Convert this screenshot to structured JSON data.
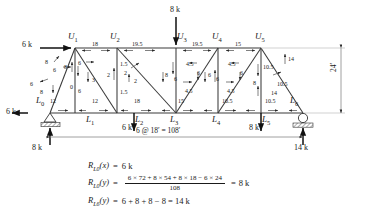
{
  "diagram": {
    "span_dimension": "6 @ 18′ = 108′",
    "height_dimension": "24′",
    "nodes": {
      "top": [
        {
          "name": "U1",
          "base": "U",
          "sub": "1",
          "x": 75,
          "y": 48
        },
        {
          "name": "U2",
          "base": "U",
          "sub": "2",
          "x": 117,
          "y": 48
        },
        {
          "name": "U3",
          "base": "U",
          "sub": "3",
          "x": 176,
          "y": 48
        },
        {
          "name": "U4",
          "base": "U",
          "sub": "4",
          "x": 218,
          "y": 48
        },
        {
          "name": "U5",
          "base": "U",
          "sub": "5",
          "x": 261,
          "y": 48
        }
      ],
      "bottom": [
        {
          "name": "L0",
          "base": "L",
          "sub": "0",
          "x": 50,
          "y": 113
        },
        {
          "name": "L1",
          "base": "L",
          "sub": "1",
          "x": 92,
          "y": 113
        },
        {
          "name": "L2",
          "base": "L",
          "sub": "2",
          "x": 134,
          "y": 113
        },
        {
          "name": "L3",
          "base": "L",
          "sub": "3",
          "x": 176,
          "y": 113
        },
        {
          "name": "L4",
          "base": "L",
          "sub": "4",
          "x": 218,
          "y": 113
        },
        {
          "name": "L5",
          "base": "L",
          "sub": "5",
          "x": 261,
          "y": 113
        },
        {
          "name": "L6",
          "base": "L",
          "sub": "6",
          "x": 303,
          "y": 113
        }
      ]
    },
    "applied_loads": [
      {
        "label": "6 k",
        "at": "U1",
        "direction": "right-horizontal"
      },
      {
        "label": "8 k",
        "at": "U3",
        "direction": "down-vertical"
      },
      {
        "label": "6 k",
        "at": "L2",
        "direction": "down-vertical"
      },
      {
        "label": "8 k",
        "at": "L5",
        "direction": "down-vertical"
      },
      {
        "label": "6 k",
        "at": "L0",
        "direction": "left-horizontal"
      }
    ],
    "reactions": [
      {
        "label": "8 k",
        "at": "L0",
        "direction": "up-vertical"
      },
      {
        "label": "14 k",
        "at": "L6",
        "direction": "up-vertical"
      }
    ],
    "top_chord_forces": [
      "18",
      "19.5",
      "19.5",
      "15",
      "14"
    ],
    "bottom_chord_forces": [
      "12",
      "12",
      "18",
      "15",
      "10.5",
      "10.5"
    ],
    "vertical_forces": [
      "0",
      "2",
      "8",
      "6",
      "8"
    ],
    "diagonal_forces": [
      "8",
      "6",
      "3",
      "2",
      "6",
      "6",
      "6",
      "14"
    ],
    "member_force_labels": [
      {
        "text": "6 k",
        "x": 22,
        "y": 41,
        "cls": "load"
      },
      {
        "text": "8 k",
        "x": 170,
        "y": 6,
        "cls": "load"
      },
      {
        "text": "6 k",
        "x": 122,
        "y": 124,
        "cls": "load"
      },
      {
        "text": "8 k",
        "x": 249,
        "y": 124,
        "cls": "load"
      },
      {
        "text": "6 k",
        "x": 6,
        "y": 108,
        "cls": "load"
      },
      {
        "text": "8 k",
        "x": 32,
        "y": 144,
        "cls": "load"
      },
      {
        "text": "14 k",
        "x": 294,
        "y": 144,
        "cls": "load"
      },
      {
        "text": "18",
        "x": 92,
        "y": 41,
        "cls": "force"
      },
      {
        "text": "19.5",
        "x": 132,
        "y": 41,
        "cls": "force"
      },
      {
        "text": "19.5",
        "x": 192,
        "y": 41,
        "cls": "force"
      },
      {
        "text": "15",
        "x": 235,
        "y": 41,
        "cls": "force"
      },
      {
        "text": "14",
        "x": 288,
        "y": 56,
        "cls": "force"
      },
      {
        "text": "8",
        "x": 45,
        "y": 59,
        "cls": "force"
      },
      {
        "text": "6",
        "x": 53,
        "y": 67,
        "cls": "force"
      },
      {
        "text": "6",
        "x": 30,
        "y": 81,
        "cls": "force"
      },
      {
        "text": "8",
        "x": 40,
        "y": 89,
        "cls": "force"
      },
      {
        "text": "12",
        "x": 50,
        "y": 98,
        "cls": "force"
      },
      {
        "text": "8",
        "x": 64,
        "y": 64,
        "cls": "force"
      },
      {
        "text": "6",
        "x": 78,
        "y": 60,
        "cls": "force"
      },
      {
        "text": "0",
        "x": 70,
        "y": 84,
        "cls": "force"
      },
      {
        "text": "3",
        "x": 92,
        "y": 77,
        "cls": "force"
      },
      {
        "text": "6",
        "x": 78,
        "y": 88,
        "cls": "force"
      },
      {
        "text": "12",
        "x": 92,
        "y": 98,
        "cls": "force"
      },
      {
        "text": "2",
        "x": 107,
        "y": 72,
        "cls": "force"
      },
      {
        "text": "1.5",
        "x": 120,
        "y": 61,
        "cls": "force"
      },
      {
        "text": "2",
        "x": 124,
        "y": 70,
        "cls": "force"
      },
      {
        "text": "2",
        "x": 134,
        "y": 78,
        "cls": "force"
      },
      {
        "text": "1.5",
        "x": 120,
        "y": 89,
        "cls": "force"
      },
      {
        "text": "18",
        "x": 134,
        "y": 98,
        "cls": "force"
      },
      {
        "text": "8",
        "x": 165,
        "y": 72,
        "cls": "force"
      },
      {
        "text": "4.5",
        "x": 186,
        "y": 61,
        "cls": "force"
      },
      {
        "text": "6",
        "x": 174,
        "y": 76,
        "cls": "force"
      },
      {
        "text": "6",
        "x": 197,
        "y": 70,
        "cls": "force"
      },
      {
        "text": "4.5",
        "x": 185,
        "y": 88,
        "cls": "force"
      },
      {
        "text": "15",
        "x": 178,
        "y": 98,
        "cls": "force"
      },
      {
        "text": "6",
        "x": 208,
        "y": 72,
        "cls": "force"
      },
      {
        "text": "4.5",
        "x": 228,
        "y": 61,
        "cls": "force"
      },
      {
        "text": "6",
        "x": 216,
        "y": 76,
        "cls": "force"
      },
      {
        "text": "6",
        "x": 240,
        "y": 70,
        "cls": "force"
      },
      {
        "text": "4.5",
        "x": 227,
        "y": 88,
        "cls": "force"
      },
      {
        "text": "10.5",
        "x": 222,
        "y": 98,
        "cls": "force"
      },
      {
        "text": "10.5",
        "x": 263,
        "y": 64,
        "cls": "force"
      },
      {
        "text": "8",
        "x": 253,
        "y": 80,
        "cls": "force"
      },
      {
        "text": "10.5",
        "x": 277,
        "y": 81,
        "cls": "force"
      },
      {
        "text": "14",
        "x": 271,
        "y": 90,
        "cls": "force"
      },
      {
        "text": "10.5",
        "x": 265,
        "y": 98,
        "cls": "force"
      }
    ]
  },
  "equations": {
    "eq1": {
      "lhs_main": "R",
      "lhs_sub": "L0",
      "lhs_arg": "(x)",
      "eq": "=",
      "rhs": "6 k"
    },
    "eq2": {
      "lhs_main": "R",
      "lhs_sub": "L0",
      "lhs_arg": "(y)",
      "eq": "=",
      "numerator": "6 × 72 + 8 × 54 + 8 × 18 − 6 × 24",
      "denominator": "108",
      "result_eq": "=",
      "rhs": "8 k"
    },
    "eq3": {
      "lhs_main": "R",
      "lhs_sub": "L6",
      "lhs_arg": "(y)",
      "eq": "=",
      "rhs": "6 + 8 + 8 − 8 = 14 k"
    }
  }
}
